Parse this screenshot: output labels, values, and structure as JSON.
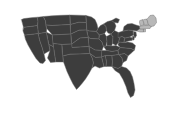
{
  "map": {
    "title": "United States choropleth map",
    "region_name": "United States of America",
    "projection": "albers-usa",
    "width": 173,
    "height": 116,
    "background_color": "#ffffff",
    "default_state_color": "#3d3d3d",
    "highlight_state_color": "#b8b8b8",
    "border_color": "#6e6e6e",
    "border_width": 0.45,
    "legend": {
      "visible": false,
      "entries": [
        {
          "label": "Highlighted",
          "color": "#b8b8b8"
        },
        {
          "label": "Other states",
          "color": "#3d3d3d"
        }
      ]
    },
    "labels": {
      "visible": false
    },
    "highlighted_states": [
      "ME",
      "NH",
      "VT",
      "MA",
      "RI",
      "CT"
    ],
    "states": [
      {
        "code": "WA",
        "name": "Washington",
        "highlighted": false
      },
      {
        "code": "OR",
        "name": "Oregon",
        "highlighted": false
      },
      {
        "code": "CA",
        "name": "California",
        "highlighted": false
      },
      {
        "code": "NV",
        "name": "Nevada",
        "highlighted": false
      },
      {
        "code": "ID",
        "name": "Idaho",
        "highlighted": false
      },
      {
        "code": "MT",
        "name": "Montana",
        "highlighted": false
      },
      {
        "code": "WY",
        "name": "Wyoming",
        "highlighted": false
      },
      {
        "code": "UT",
        "name": "Utah",
        "highlighted": false
      },
      {
        "code": "AZ",
        "name": "Arizona",
        "highlighted": false
      },
      {
        "code": "CO",
        "name": "Colorado",
        "highlighted": false
      },
      {
        "code": "NM",
        "name": "New Mexico",
        "highlighted": false
      },
      {
        "code": "ND",
        "name": "North Dakota",
        "highlighted": false
      },
      {
        "code": "SD",
        "name": "South Dakota",
        "highlighted": false
      },
      {
        "code": "NE",
        "name": "Nebraska",
        "highlighted": false
      },
      {
        "code": "KS",
        "name": "Kansas",
        "highlighted": false
      },
      {
        "code": "OK",
        "name": "Oklahoma",
        "highlighted": false
      },
      {
        "code": "TX",
        "name": "Texas",
        "highlighted": false
      },
      {
        "code": "MN",
        "name": "Minnesota",
        "highlighted": false
      },
      {
        "code": "IA",
        "name": "Iowa",
        "highlighted": false
      },
      {
        "code": "MO",
        "name": "Missouri",
        "highlighted": false
      },
      {
        "code": "AR",
        "name": "Arkansas",
        "highlighted": false
      },
      {
        "code": "LA",
        "name": "Louisiana",
        "highlighted": false
      },
      {
        "code": "WI",
        "name": "Wisconsin",
        "highlighted": false
      },
      {
        "code": "IL",
        "name": "Illinois",
        "highlighted": false
      },
      {
        "code": "MI",
        "name": "Michigan",
        "highlighted": false
      },
      {
        "code": "IN",
        "name": "Indiana",
        "highlighted": false
      },
      {
        "code": "OH",
        "name": "Ohio",
        "highlighted": false
      },
      {
        "code": "KY",
        "name": "Kentucky",
        "highlighted": false
      },
      {
        "code": "TN",
        "name": "Tennessee",
        "highlighted": false
      },
      {
        "code": "MS",
        "name": "Mississippi",
        "highlighted": false
      },
      {
        "code": "AL",
        "name": "Alabama",
        "highlighted": false
      },
      {
        "code": "GA",
        "name": "Georgia",
        "highlighted": false
      },
      {
        "code": "FL",
        "name": "Florida",
        "highlighted": false
      },
      {
        "code": "SC",
        "name": "South Carolina",
        "highlighted": false
      },
      {
        "code": "NC",
        "name": "North Carolina",
        "highlighted": false
      },
      {
        "code": "VA",
        "name": "Virginia",
        "highlighted": false
      },
      {
        "code": "WV",
        "name": "West Virginia",
        "highlighted": false
      },
      {
        "code": "MD",
        "name": "Maryland",
        "highlighted": false
      },
      {
        "code": "DE",
        "name": "Delaware",
        "highlighted": false
      },
      {
        "code": "PA",
        "name": "Pennsylvania",
        "highlighted": false
      },
      {
        "code": "NJ",
        "name": "New Jersey",
        "highlighted": false
      },
      {
        "code": "NY",
        "name": "New York",
        "highlighted": false
      },
      {
        "code": "CT",
        "name": "Connecticut",
        "highlighted": true
      },
      {
        "code": "RI",
        "name": "Rhode Island",
        "highlighted": true
      },
      {
        "code": "MA",
        "name": "Massachusetts",
        "highlighted": true
      },
      {
        "code": "VT",
        "name": "Vermont",
        "highlighted": true
      },
      {
        "code": "NH",
        "name": "New Hampshire",
        "highlighted": true
      },
      {
        "code": "ME",
        "name": "Maine",
        "highlighted": true
      }
    ]
  }
}
